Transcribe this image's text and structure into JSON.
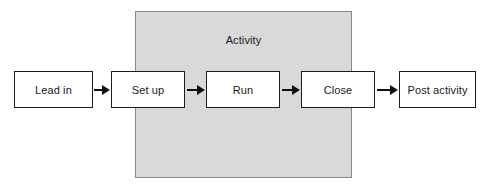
{
  "diagram": {
    "region": {
      "label": "Activity",
      "fill_color": "#d9d9d9",
      "border_color": "#8a8a8a"
    },
    "nodes": [
      {
        "id": "lead-in",
        "label": "Lead in",
        "x": 14,
        "y": 71,
        "width": 79,
        "height": 37
      },
      {
        "id": "set-up",
        "label": "Set up",
        "x": 111,
        "y": 71,
        "width": 74,
        "height": 37
      },
      {
        "id": "run",
        "label": "Run",
        "x": 206,
        "y": 71,
        "width": 74,
        "height": 37
      },
      {
        "id": "close",
        "label": "Close",
        "x": 301,
        "y": 71,
        "width": 74,
        "height": 37
      },
      {
        "id": "post-activity",
        "label": "Post activity",
        "x": 399,
        "y": 71,
        "width": 77,
        "height": 37
      }
    ],
    "arrows": [
      {
        "id": "lead-in-to-set-up",
        "from": "lead-in",
        "to": "set-up",
        "x": 94,
        "y": 84,
        "width": 16
      },
      {
        "id": "set-up-to-run",
        "from": "set-up",
        "to": "run",
        "x": 187,
        "y": 84,
        "width": 18
      },
      {
        "id": "run-to-close",
        "from": "run",
        "to": "close",
        "x": 282,
        "y": 84,
        "width": 18
      },
      {
        "id": "close-to-post-activity",
        "from": "close",
        "to": "post-activity",
        "x": 377,
        "y": 84,
        "width": 21
      }
    ],
    "box_border_color": "#1c1c1c",
    "box_fill_color": "#ffffff",
    "arrow_color": "#111111",
    "text_color": "#1a1a1a",
    "background_color": "#ffffff"
  }
}
